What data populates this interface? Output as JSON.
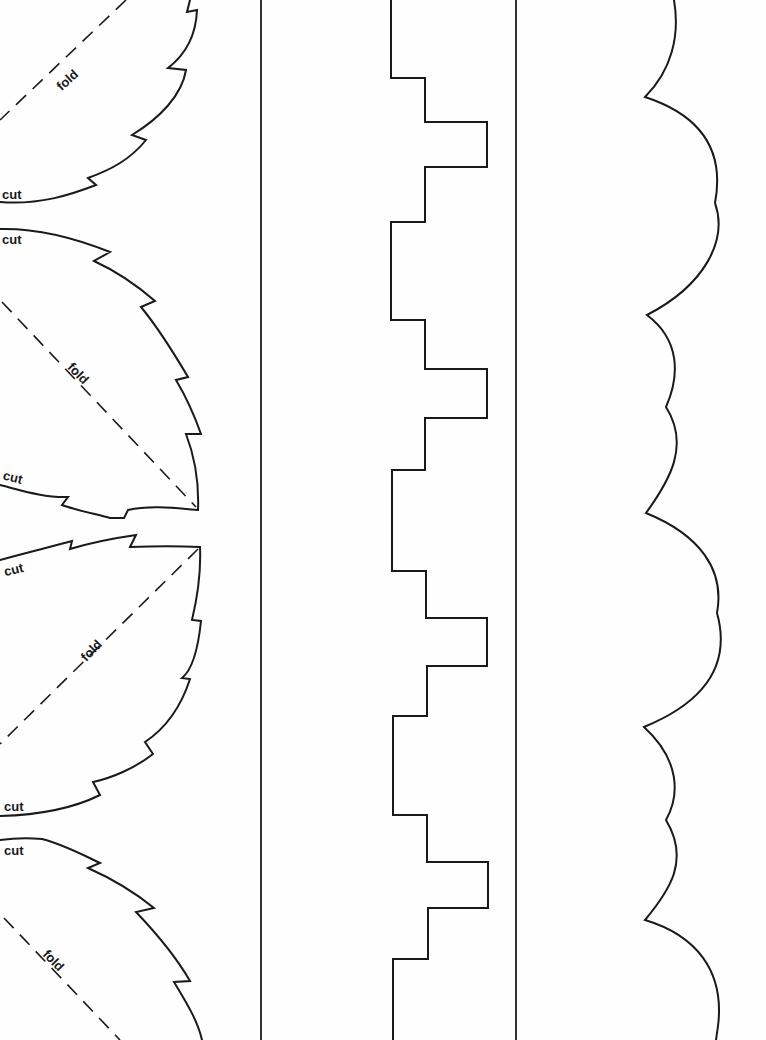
{
  "document": {
    "type": "paper cutting template",
    "columns": [
      "leaf-border",
      "stepped-border",
      "scalloped-border"
    ]
  },
  "leaves": [
    {
      "index": 1,
      "cut_label": "cut",
      "fold_label": "fold"
    },
    {
      "index": 2,
      "cut_label_top": "cut",
      "fold_label": "fold",
      "cut_label_bottom": "cut"
    },
    {
      "index": 3,
      "cut_label_top": "cut",
      "fold_label": "fold",
      "cut_label_bottom": "cut"
    },
    {
      "index": 4,
      "cut_label": "cut",
      "fold_label": "fold"
    }
  ],
  "colors": {
    "paper": "#fefefe",
    "ink": "#1a1a1a",
    "divider": "#333333"
  }
}
